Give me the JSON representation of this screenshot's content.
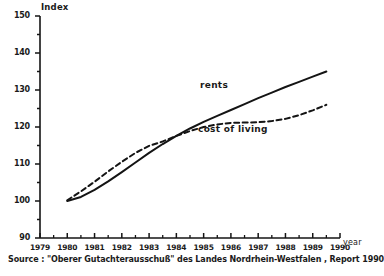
{
  "chart_data": {
    "type": "line",
    "title": "",
    "xlabel": "year",
    "ylabel": "Index",
    "xlim": [
      1979,
      1990
    ],
    "ylim": [
      90,
      150
    ],
    "y_major_step": 10,
    "y_minor_step": 5,
    "grid": false,
    "legend_position": "inline-annotation",
    "x_tick_labels": [
      "1979",
      "1980",
      "1981",
      "1982",
      "1983",
      "1984",
      "1985",
      "1986",
      "1987",
      "1988",
      "1989",
      "1990"
    ],
    "y_tick_labels": [
      "90",
      "100",
      "110",
      "120",
      "130",
      "140",
      "150"
    ],
    "series": [
      {
        "name": "rents",
        "style": "solid",
        "color": "#141414",
        "x": [
          1980.0,
          1980.5,
          1981.0,
          1981.5,
          1982.0,
          1982.5,
          1983.0,
          1983.5,
          1984.0,
          1984.5,
          1985.0,
          1985.5,
          1986.0,
          1986.5,
          1987.0,
          1987.5,
          1988.0,
          1988.5,
          1989.0,
          1989.5
        ],
        "values": [
          100.0,
          101.1,
          103.0,
          105.3,
          107.8,
          110.4,
          113.0,
          115.4,
          117.6,
          119.6,
          121.4,
          123.0,
          124.6,
          126.2,
          127.8,
          129.3,
          130.8,
          132.2,
          133.6,
          135.0
        ]
      },
      {
        "name": "cost of living",
        "style": "dashed",
        "color": "#141414",
        "x": [
          1980.0,
          1980.5,
          1981.0,
          1981.5,
          1982.0,
          1982.5,
          1983.0,
          1983.5,
          1984.0,
          1984.5,
          1985.0,
          1985.5,
          1986.0,
          1986.5,
          1987.0,
          1987.5,
          1988.0,
          1988.5,
          1989.0,
          1989.5
        ],
        "values": [
          100.2,
          102.6,
          105.2,
          108.0,
          110.6,
          113.0,
          114.9,
          116.1,
          117.6,
          118.9,
          120.0,
          120.7,
          121.1,
          121.2,
          121.3,
          121.6,
          122.2,
          123.2,
          124.5,
          126.0
        ]
      }
    ],
    "annotations": [
      {
        "text": "rents",
        "series": "rents"
      },
      {
        "text": "cost of living",
        "series": "cost of living"
      }
    ]
  },
  "source": {
    "text": "Source : \"Oberer Gutachterausschuß\" des Landes Nordrhein-Westfalen , Report 1990"
  }
}
